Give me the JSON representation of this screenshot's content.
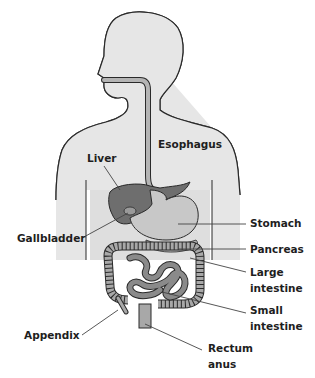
{
  "labels": {
    "esophagus": "Esophagus",
    "liver": "Liver",
    "gallbladder": "Gallbladder",
    "stomach": "Stomach",
    "pancreas": "Pancreas",
    "large_intestine_1": "Large",
    "large_intestine_2": "intestine",
    "small_intestine_1": "Small",
    "small_intestine_2": "intestine",
    "appendix": "Appendix",
    "rectum_1": "Rectum",
    "rectum_2": "anus"
  },
  "colors": {
    "body": "#e6e6e6",
    "outline": "#2a2a2a",
    "esophagus": "#b4b4b4",
    "liver": "#6e6e6e",
    "stomach": "#c8c8c8",
    "intestine": "#a8a8a8",
    "small_intestine": "#8a8a8a",
    "leader": "#444444"
  }
}
